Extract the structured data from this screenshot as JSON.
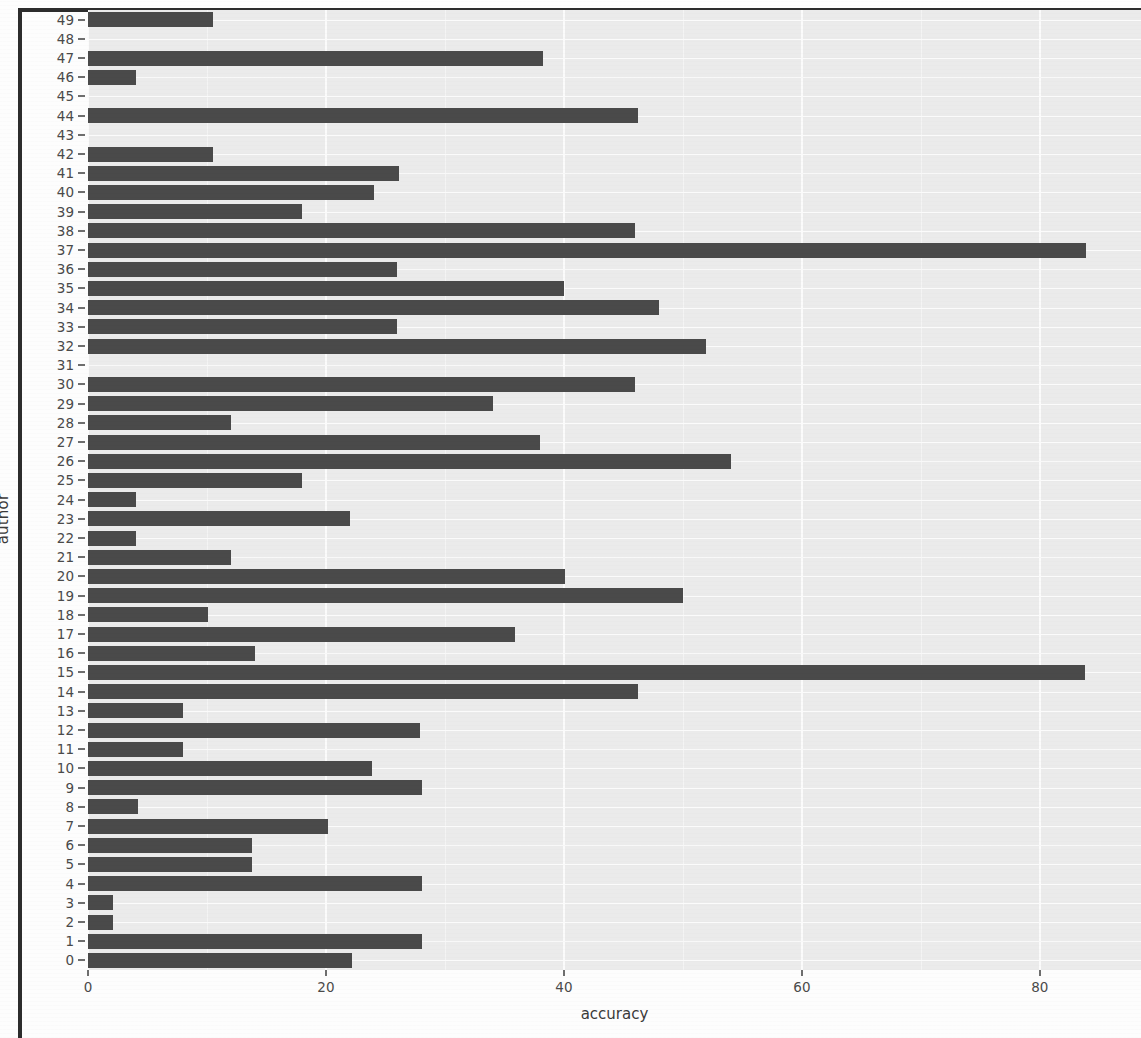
{
  "chart_data": {
    "type": "bar",
    "orientation": "horizontal",
    "title": "",
    "xlabel": "accuracy",
    "ylabel": "author",
    "xlim": [
      0,
      88.5
    ],
    "ylim": [
      -0.5,
      49.5
    ],
    "grid": true,
    "legend": null,
    "bar_color": "#4a4a4a",
    "panel_color": "#ebebeb",
    "gridline_color": "#fbfbfb",
    "x_ticks": [
      0,
      20,
      40,
      60,
      80
    ],
    "x_tick_labels": [
      "0",
      "20",
      "40",
      "60",
      "80"
    ],
    "x_minor_ticks": [
      10,
      30,
      50,
      70
    ],
    "categories": [
      "0",
      "1",
      "2",
      "3",
      "4",
      "5",
      "6",
      "7",
      "8",
      "9",
      "10",
      "11",
      "12",
      "13",
      "14",
      "15",
      "16",
      "17",
      "18",
      "19",
      "20",
      "21",
      "22",
      "23",
      "24",
      "25",
      "26",
      "27",
      "28",
      "29",
      "30",
      "31",
      "32",
      "33",
      "34",
      "35",
      "36",
      "37",
      "38",
      "39",
      "40",
      "41",
      "42",
      "43",
      "44",
      "45",
      "46",
      "47",
      "48",
      "49"
    ],
    "values": [
      22.2,
      28.1,
      2.1,
      2.1,
      28.1,
      13.8,
      13.8,
      20.2,
      4.2,
      28.1,
      23.9,
      8.0,
      27.9,
      8.0,
      46.2,
      83.8,
      14.0,
      35.9,
      10.1,
      50.0,
      40.1,
      12.0,
      4.0,
      22.0,
      4.0,
      18.0,
      54.0,
      38.0,
      12.0,
      34.0,
      46.0,
      0.0,
      51.9,
      26.0,
      48.0,
      40.0,
      26.0,
      83.9,
      46.0,
      18.0,
      24.0,
      26.1,
      10.5,
      0.0,
      46.2,
      0.0,
      4.0,
      38.2,
      0.0,
      10.5
    ]
  },
  "axis": {
    "x_title": "accuracy",
    "y_title": "author"
  }
}
